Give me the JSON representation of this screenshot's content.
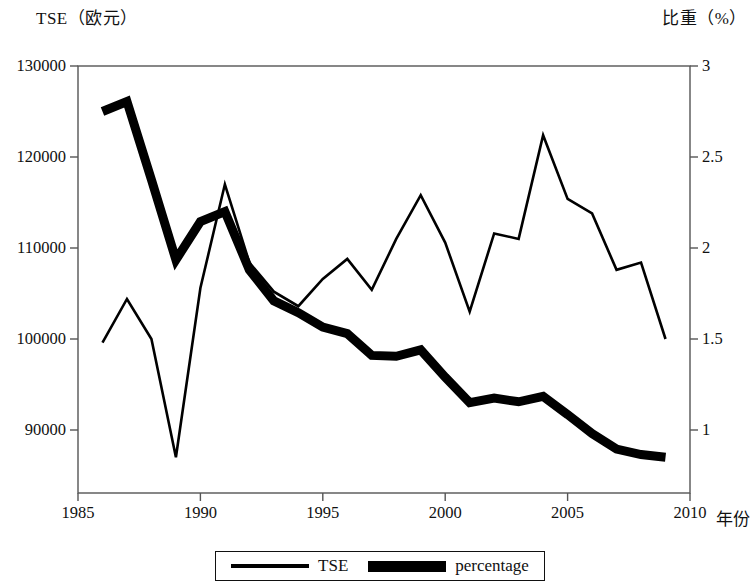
{
  "axes": {
    "left_title": "TSE（欧元）",
    "right_title": "比重（%）",
    "x_name": "年份",
    "left_ticks": [
      "130000",
      "120000",
      "110000",
      "100000",
      "90000"
    ],
    "right_ticks": [
      "3",
      "2.5",
      "2",
      "1.5",
      "1"
    ],
    "x_ticks": [
      "1985",
      "1990",
      "1995",
      "2000",
      "2005",
      "2010"
    ]
  },
  "legend": {
    "items": [
      {
        "label": "TSE",
        "style": "thick"
      },
      {
        "label": "percentage",
        "style": "thin"
      }
    ]
  },
  "colors": {
    "line": "#000000",
    "axis": "#555555",
    "background": "#ffffff"
  },
  "chart_data": {
    "type": "line",
    "title": "",
    "xlabel": "年份",
    "ylabel": "TSE（欧元）",
    "y2label": "比重（%）",
    "xlim": [
      1985,
      2010
    ],
    "ylim": [
      86000,
      130500
    ],
    "y2lim": [
      0.79,
      3.0
    ],
    "grid": false,
    "legend_position": "bottom",
    "x": [
      1986,
      1987,
      1988,
      1989,
      1990,
      1991,
      1992,
      1993,
      1994,
      1995,
      1996,
      1997,
      1998,
      1999,
      2000,
      2001,
      2002,
      2003,
      2004,
      2005,
      2006,
      2007,
      2008,
      2009
    ],
    "series": [
      {
        "name": "TSE",
        "axis": "left",
        "unit": "欧元",
        "line_style": "thick",
        "values": [
          125000,
          126100,
          117500,
          108700,
          112900,
          114000,
          107600,
          104200,
          102900,
          101300,
          100600,
          98200,
          98100,
          98800,
          95800,
          93000,
          93500,
          93100,
          93700,
          91700,
          89600,
          87900,
          87300,
          87000
        ]
      },
      {
        "name": "percentage",
        "axis": "right",
        "unit": "%",
        "line_style": "thin",
        "values": [
          1.48,
          1.72,
          1.5,
          0.85,
          1.78,
          2.35,
          1.92,
          1.76,
          1.68,
          1.83,
          1.94,
          1.77,
          2.05,
          2.29,
          2.03,
          1.65,
          2.08,
          2.05,
          2.62,
          2.27,
          2.19,
          1.88,
          1.92,
          1.5
        ]
      }
    ]
  }
}
